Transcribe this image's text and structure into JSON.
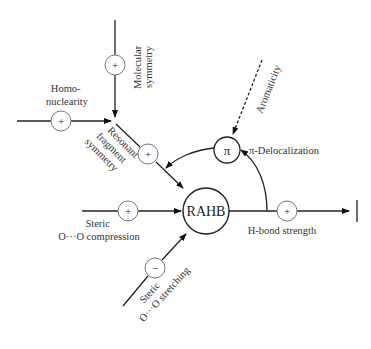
{
  "diagram": {
    "central_node": {
      "label": "RAHB"
    },
    "pi_node": {
      "symbol": "π",
      "label": "π-Delocalization"
    },
    "factors": [
      {
        "id": "molecular-symmetry",
        "lines": [
          "Molecular",
          "symmetry"
        ],
        "sign": "+"
      },
      {
        "id": "homonuclearity",
        "lines": [
          "Homo-",
          "nuclearity"
        ],
        "sign": "+"
      },
      {
        "id": "resonant-fragment-symmetry",
        "lines": [
          "Resonant",
          "fragment",
          "symmetry"
        ],
        "sign": "+"
      },
      {
        "id": "steric-compression",
        "lines": [
          "Steric",
          "O···O compression"
        ],
        "sign": "+"
      },
      {
        "id": "steric-stretching",
        "lines": [
          "Steric",
          "O···O stretching"
        ],
        "sign": "−"
      },
      {
        "id": "aromaticity",
        "lines": [
          "Aromaticity"
        ],
        "sign": ""
      },
      {
        "id": "hbond-strength",
        "lines": [
          "H-bond strength"
        ],
        "sign": "+"
      }
    ]
  }
}
